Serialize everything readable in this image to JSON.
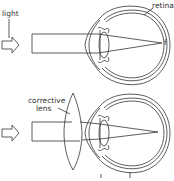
{
  "diagram": {
    "top": {
      "light_label": "light",
      "retina_label": "retina",
      "focus_label": "f"
    },
    "bottom": {
      "lens_label_line1": "corrective",
      "lens_label_line2": "lens"
    },
    "colors": {
      "stroke": "#333333",
      "background": "#ffffff"
    }
  }
}
